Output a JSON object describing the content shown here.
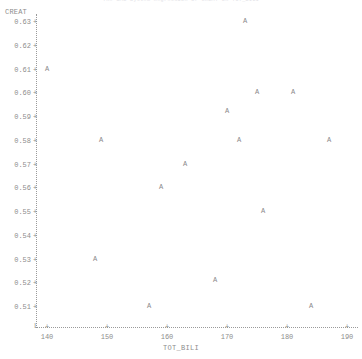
{
  "chart_data": {
    "type": "scatter",
    "title": "The SAS System   Regression of CREAT on TOT_BILI",
    "xlabel": "TOT_BILI",
    "ylabel": "CREAT",
    "plot_symbol": "A",
    "xlim": [
      140,
      190
    ],
    "ylim": [
      0.51,
      0.63
    ],
    "grid": false,
    "legend": null,
    "xticks": [
      140,
      150,
      160,
      170,
      180,
      190
    ],
    "xtick_labels": [
      "140",
      "150",
      "160",
      "170",
      "180",
      "190"
    ],
    "yticks": [
      0.63,
      0.62,
      0.61,
      0.6,
      0.59,
      0.58,
      0.57,
      0.56,
      0.55,
      0.54,
      0.53,
      0.52,
      0.51
    ],
    "ytick_labels": [
      "0.63",
      "0.62",
      "0.61",
      "0.60",
      "0.59",
      "0.58",
      "0.57",
      "0.56",
      "0.55",
      "0.54",
      "0.53",
      "0.52",
      "0.51"
    ],
    "points": [
      {
        "x": 173,
        "y": 0.63,
        "label": "A"
      },
      {
        "x": 140,
        "y": 0.61,
        "label": "A"
      },
      {
        "x": 175,
        "y": 0.6,
        "label": "A"
      },
      {
        "x": 181,
        "y": 0.6,
        "label": "A"
      },
      {
        "x": 170,
        "y": 0.592,
        "label": "A"
      },
      {
        "x": 149,
        "y": 0.58,
        "label": "A"
      },
      {
        "x": 172,
        "y": 0.58,
        "label": "A"
      },
      {
        "x": 187,
        "y": 0.58,
        "label": "A"
      },
      {
        "x": 163,
        "y": 0.57,
        "label": "A"
      },
      {
        "x": 159,
        "y": 0.56,
        "label": "A"
      },
      {
        "x": 176,
        "y": 0.55,
        "label": "A"
      },
      {
        "x": 148,
        "y": 0.53,
        "label": "A"
      },
      {
        "x": 168,
        "y": 0.521,
        "label": "A"
      },
      {
        "x": 157,
        "y": 0.51,
        "label": "A"
      },
      {
        "x": 184,
        "y": 0.51,
        "label": "A"
      }
    ],
    "colors": {
      "axis": "#8d8d8d",
      "point": "#8a8a8a",
      "background": "#ffffff",
      "title": "#e2e2e6"
    }
  }
}
